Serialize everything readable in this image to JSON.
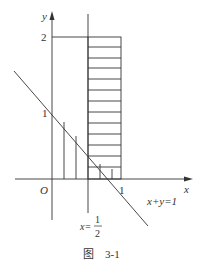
{
  "figure": {
    "caption_prefix": "图",
    "caption_number": "3-1"
  },
  "axes": {
    "x_label": "x",
    "y_label": "y",
    "origin_label": "O",
    "x_ticks": [
      {
        "value": 1,
        "label": "1"
      }
    ],
    "y_ticks": [
      {
        "value": 1,
        "label": "1"
      },
      {
        "value": 2,
        "label": "2"
      }
    ]
  },
  "lines": {
    "diagonal_label": "x+y=1",
    "vertical_label_prefix": "x=",
    "vertical_label_num": "1",
    "vertical_label_den": "2"
  },
  "regions": {
    "rectangle": {
      "x_range": [
        0.5,
        1
      ],
      "y_range": [
        0,
        2
      ],
      "hatch": "horizontal"
    },
    "triangle": {
      "description": "region under x+y=1 for 0<=x<=1",
      "hatch": "vertical"
    }
  },
  "colors": {
    "stroke": "#333333",
    "background": "#ffffff"
  }
}
